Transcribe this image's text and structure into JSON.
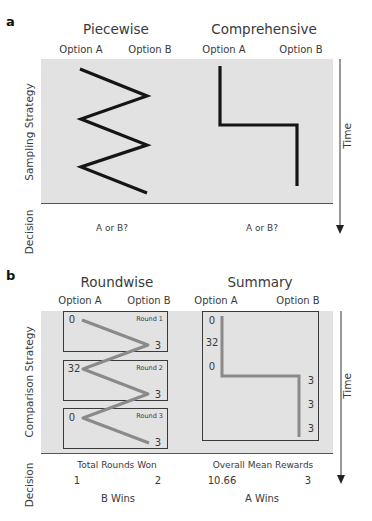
{
  "panel_a": {
    "label": "a",
    "left_title": "Piecewise",
    "right_title": "Comprehensive",
    "options": {
      "a": "Option A",
      "b": "Option B"
    },
    "row_labels": {
      "strategy": "Sampling Strategy",
      "decision": "Decision"
    },
    "time_label": "Time",
    "left_decision": "A or B?",
    "right_decision": "A or B?"
  },
  "panel_b": {
    "label": "b",
    "left_title": "Roundwise",
    "right_title": "Summary",
    "options": {
      "a": "Option A",
      "b": "Option B"
    },
    "row_labels": {
      "strategy": "Comparison Strategy",
      "decision": "Decision"
    },
    "time_label": "Time",
    "rounds": [
      {
        "label": "Round 1",
        "a": "0",
        "b": "3"
      },
      {
        "label": "Round 2",
        "a": "32",
        "b": "3"
      },
      {
        "label": "Round 3",
        "a": "0",
        "b": "3"
      }
    ],
    "summary_a_values": [
      "0",
      "32",
      "0"
    ],
    "summary_b_values": [
      "3",
      "3",
      "3"
    ],
    "left_decision": {
      "title": "Total Rounds Won",
      "a": "1",
      "b": "2",
      "result": "B Wins"
    },
    "right_decision": {
      "title": "Overall Mean Rewards",
      "a": "10.66",
      "b": "3",
      "result": "A Wins"
    }
  },
  "colors": {
    "panel_bg": "#e2e2e2",
    "sampling_line": "#151515",
    "comparison_line": "#8a8a8a",
    "box_border": "#3a3a3a"
  }
}
